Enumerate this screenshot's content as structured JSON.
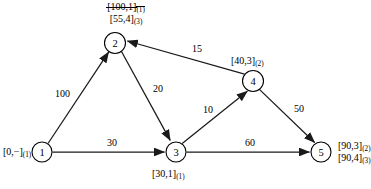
{
  "diagram": {
    "nodes": [
      {
        "id": "1",
        "label": "1",
        "cx": 42,
        "cy": 152,
        "r": 10
      },
      {
        "id": "2",
        "label": "2",
        "cx": 115,
        "cy": 43,
        "r": 10.5
      },
      {
        "id": "3",
        "label": "3",
        "cx": 176,
        "cy": 152,
        "r": 10
      },
      {
        "id": "4",
        "label": "4",
        "cx": 253,
        "cy": 81,
        "r": 10.5
      },
      {
        "id": "5",
        "label": "5",
        "cx": 321,
        "cy": 152,
        "r": 10
      }
    ],
    "edges": [
      {
        "from": "1",
        "to": "2",
        "weight": "100"
      },
      {
        "from": "1",
        "to": "3",
        "weight": "30"
      },
      {
        "from": "2",
        "to": "3",
        "weight": "20"
      },
      {
        "from": "3",
        "to": "4",
        "weight": "10"
      },
      {
        "from": "3",
        "to": "5",
        "weight": "60"
      },
      {
        "from": "4",
        "to": "2",
        "weight": "15"
      },
      {
        "from": "4",
        "to": "5",
        "weight": "50"
      }
    ],
    "node_labels": {
      "node1": {
        "text": "[0,−]",
        "iter": "(1)"
      },
      "node2_old": {
        "text": "[100,1]",
        "iter": "(1)",
        "crossed_out": "true"
      },
      "node2_new": {
        "text": "[55,4]",
        "iter": "(3)"
      },
      "node3": {
        "text": "[30,1]",
        "iter": "(1)"
      },
      "node4": {
        "text": "[40,3]",
        "iter": "(2)"
      },
      "node5_a": {
        "text": "[90,3]",
        "iter": "(2)"
      },
      "node5_b": {
        "text": "[90,4]",
        "iter": "(3)"
      }
    },
    "colors": {
      "line": "#1a1a1a",
      "node_fill": "#ffffff",
      "text": "#000000",
      "background": "#ffffff"
    }
  }
}
